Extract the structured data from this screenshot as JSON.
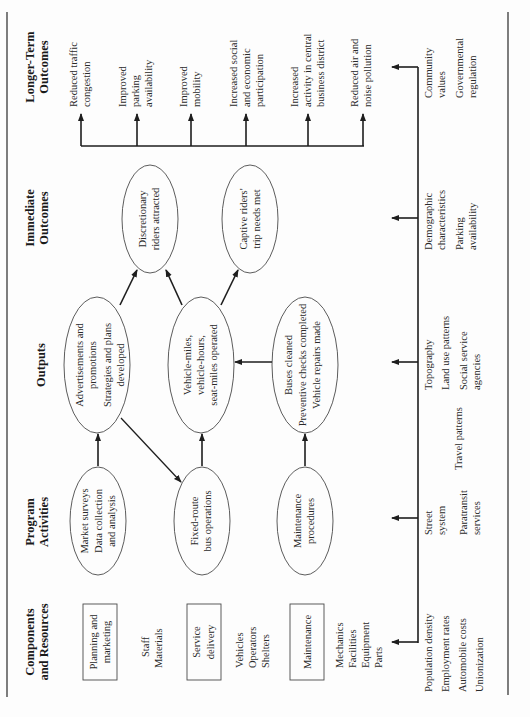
{
  "figure": {
    "orientation": "rotated-90-ccw",
    "columns": [
      {
        "id": "components",
        "header_line1": "Components",
        "header_line2": "and Resources"
      },
      {
        "id": "activities",
        "header_line1": "Program",
        "header_line2": "Activities"
      },
      {
        "id": "outputs",
        "header_line1": "Outputs",
        "header_line2": ""
      },
      {
        "id": "immediate",
        "header_line1": "Immediate",
        "header_line2": "Outcomes"
      },
      {
        "id": "longer",
        "header_line1": "Longer-Term",
        "header_line2": "Outcomes"
      }
    ],
    "components": [
      {
        "box_line1": "Planning and",
        "box_line2": "marketing",
        "resources": [
          "Staff",
          "Materials"
        ]
      },
      {
        "box_line1": "Service",
        "box_line2": "delivery",
        "resources": [
          "Vehicles",
          "Operators",
          "Shelters"
        ]
      },
      {
        "box_line1": "Maintenance",
        "box_line2": "",
        "resources": [
          "Mechanics",
          "Facilities",
          "Equipment",
          "Parts"
        ]
      }
    ],
    "activities": [
      {
        "lines": [
          "Market surveys",
          "Data collection",
          "and analysis"
        ]
      },
      {
        "lines": [
          "Fixed-route",
          "bus operations"
        ]
      },
      {
        "lines": [
          "Maintenance",
          "procedures"
        ]
      }
    ],
    "outputs": [
      {
        "lines": [
          "Advertisements and",
          "promotions",
          "Strategies and plans",
          "developed"
        ]
      },
      {
        "lines": [
          "Vehicle-miles,",
          "vehicle-hours,",
          "seat-miles operated"
        ]
      },
      {
        "lines": [
          "Buses cleaned",
          "Preventive checks completed",
          "Vehicle repairs made"
        ]
      }
    ],
    "immediate_outcomes": [
      {
        "lines": [
          "Discretionary",
          "riders attracted"
        ]
      },
      {
        "lines": [
          "Captive riders'",
          "trip needs met"
        ]
      }
    ],
    "longer_term_outcomes": [
      {
        "lines": [
          "Reduced traffic",
          "congestion"
        ]
      },
      {
        "lines": [
          "Improved",
          "parking",
          "availability"
        ]
      },
      {
        "lines": [
          "Improved",
          "mobility"
        ]
      },
      {
        "lines": [
          "Increased social",
          "and economic",
          "participation"
        ]
      },
      {
        "lines": [
          "Increased",
          "activity in central",
          "business district"
        ]
      },
      {
        "lines": [
          "Reduced air and",
          "noise pollution"
        ]
      }
    ],
    "contextual_factors": {
      "components": [
        "Population density",
        "Employment rates",
        "Automobile costs",
        "Unionization"
      ],
      "activities": [
        "Street",
        "system",
        "Paratransit",
        "services"
      ],
      "activities_outputs": [
        "Travel patterns"
      ],
      "outputs": [
        "Topography",
        "Land use patterns",
        "Social service",
        "agencies"
      ],
      "immediate": [
        "Demographic",
        "characteristics",
        "Parking",
        "availability"
      ],
      "longer": [
        "Community",
        "values",
        "Governmental",
        "regulation"
      ]
    }
  }
}
